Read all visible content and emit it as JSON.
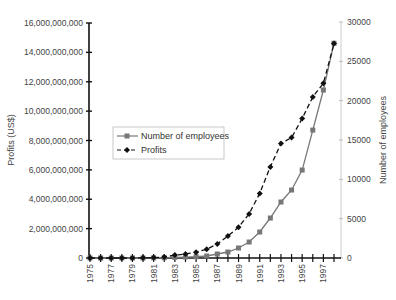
{
  "chart_data": {
    "type": "line",
    "title": "",
    "xlabel": "",
    "ylabel": "Profits (US$)",
    "ylabel_right": "Number of employees",
    "x": [
      1975,
      1976,
      1977,
      1978,
      1979,
      1980,
      1981,
      1982,
      1983,
      1984,
      1985,
      1986,
      1987,
      1988,
      1989,
      1990,
      1991,
      1992,
      1993,
      1994,
      1995,
      1996,
      1997,
      1998
    ],
    "x_tick_labels": [
      "1975",
      "1977",
      "1979",
      "1981",
      "1983",
      "1985",
      "1987",
      "1989",
      "1991",
      "1993",
      "1995",
      "1997"
    ],
    "ylim": [
      0,
      16000000000
    ],
    "ylim_right": [
      0,
      30000
    ],
    "y_ticks": [
      0,
      2000000000,
      4000000000,
      6000000000,
      8000000000,
      10000000000,
      12000000000,
      14000000000,
      16000000000
    ],
    "y_tick_labels": [
      "0",
      "2,000,000,000",
      "4,000,000,000",
      "6,000,000,000",
      "8,000,000,000",
      "10,000,000,000",
      "12,000,000,000",
      "14,000,000,000",
      "16,000,000,000"
    ],
    "y_right_ticks": [
      0,
      5000,
      10000,
      15000,
      20000,
      25000,
      30000
    ],
    "y_right_tick_labels": [
      "0",
      "5000",
      "10000",
      "15000",
      "20000",
      "25000",
      "30000"
    ],
    "grid": false,
    "legend_position": "inside-left-middle",
    "series": [
      {
        "name": "Number of employees",
        "axis": "right",
        "style": "solid",
        "marker": "square",
        "color": "#777777",
        "values": [
          0,
          0,
          0,
          0,
          0,
          0,
          20,
          40,
          80,
          120,
          170,
          250,
          510,
          760,
          1270,
          2030,
          3300,
          5080,
          7115,
          8640,
          11180,
          16260,
          21350,
          27300
        ]
      },
      {
        "name": "Profits",
        "axis": "left",
        "style": "dashed",
        "marker": "diamond",
        "color": "#111111",
        "values": [
          0,
          0,
          0,
          0,
          0,
          10000000,
          30000000,
          70000000,
          200000000,
          270000000,
          400000000,
          600000000,
          950000000,
          1500000000,
          2100000000,
          3000000000,
          4400000000,
          6200000000,
          7800000000,
          8200000000,
          9500000000,
          10970000000,
          11900000000,
          14600000000
        ]
      }
    ]
  },
  "legend": {
    "items": [
      {
        "label": "Number of employees"
      },
      {
        "label": "Profits"
      }
    ]
  },
  "axes": {
    "left_title": "Profits (US$)",
    "right_title": "Number of employees"
  }
}
